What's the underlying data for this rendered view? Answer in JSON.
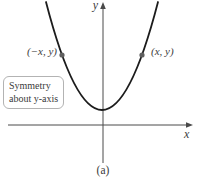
{
  "figure": {
    "caption": "(a)",
    "axis_labels": {
      "x": "x",
      "y": "y"
    },
    "callout": {
      "line1": "Symmetry",
      "line2": "about y-axis"
    },
    "points": {
      "left": {
        "label": "(−x, y)"
      },
      "right": {
        "label": "(x, y)"
      }
    },
    "colors": {
      "axis": "#4a4a4a",
      "curve": "#1c1c1c",
      "point": "#5f5f5f",
      "callout_border": "#b3b3b3",
      "text": "#3a3a3a",
      "background": "#ffffff"
    }
  }
}
